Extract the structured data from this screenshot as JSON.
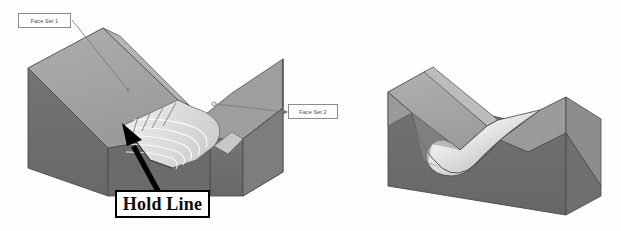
{
  "figure": {
    "background_color": "#ffffff"
  },
  "callouts": [
    {
      "id": "face-set-1",
      "label": "Face Set 1",
      "style": "thin-box-leader",
      "leader_from": [
        71,
        20
      ],
      "leader_to": [
        128,
        90
      ],
      "endpoint": "small-circle"
    },
    {
      "id": "face-set-2",
      "label": "Face Set 2",
      "style": "thin-box-leader",
      "leader_from": [
        286,
        112
      ],
      "leader_to": [
        213,
        104
      ],
      "endpoint": "small-circle"
    },
    {
      "id": "hold-line",
      "label": "Hold Line",
      "style": "bold-box-arrow",
      "leader_from": [
        163,
        190
      ],
      "leader_to": [
        124,
        125
      ],
      "endpoint": "solid-arrowhead"
    }
  ],
  "models": {
    "left": {
      "name": "v-block-with-construction-blend",
      "faces": {
        "top_left_slope": "#a3a3a3",
        "front_left_dark": "#6f6f6f",
        "inner_left_wall": "#9b9b9b",
        "right_wing_top": "#9d9d9d",
        "right_wing_front": "#6c6c6c",
        "blend_surface": "#e8e8e8"
      },
      "isocurve_color": "#ffffff",
      "isocurve_count": 7
    },
    "right": {
      "name": "v-block-with-finished-blend",
      "faces": {
        "top_left_slope": "#a5a5a5",
        "front_dark": "#6e6e6e",
        "right_slope": "#949494",
        "blend_highlight": "#dcdcdc"
      }
    }
  },
  "colors": {
    "dark_face": "#6e6e6e",
    "mid_face": "#8c8c8c",
    "light_face": "#a8a8a8",
    "highlight": "#e4e4e4",
    "outline": "#3c3c3c",
    "leader_line": "#7a7a7a",
    "arrow_black": "#000000"
  }
}
